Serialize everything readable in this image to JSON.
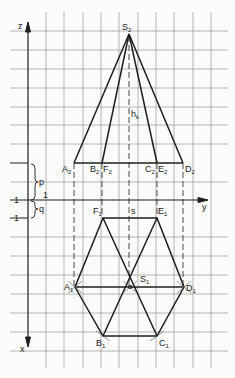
{
  "diagram": {
    "type": "orthographic-projection",
    "colors": {
      "grid": "#9a9a9a",
      "lines": "#1e1e1e",
      "background": "#fbfbfa"
    },
    "axes": {
      "z_label": "z",
      "x_label": "x",
      "y_label": "y"
    },
    "front_view": {
      "apex": {
        "label": "S",
        "sub": "2",
        "x": 129,
        "y": 33
      },
      "height_label": {
        "text": "h",
        "sub": "k"
      },
      "base_points": [
        {
          "label": "A",
          "sub": "2",
          "x": 74
        },
        {
          "label": "B",
          "sub": "2",
          "x": 102
        },
        {
          "label": "F",
          "sub": "2",
          "x": 102
        },
        {
          "label": "C",
          "sub": "2",
          "x": 157
        },
        {
          "label": "E",
          "sub": "2",
          "x": 157
        },
        {
          "label": "D",
          "sub": "2",
          "x": 183
        }
      ],
      "base_y": 163
    },
    "top_view": {
      "center": {
        "label": "S",
        "sub": "1",
        "x": 130,
        "y": 287
      },
      "points": [
        {
          "label": "A",
          "sub": "1",
          "x": 75,
          "y": 287
        },
        {
          "label": "B",
          "sub": "1",
          "x": 103,
          "y": 336
        },
        {
          "label": "C",
          "sub": "1",
          "x": 157,
          "y": 336
        },
        {
          "label": "D",
          "sub": "1",
          "x": 184,
          "y": 287
        },
        {
          "label": "E",
          "sub": "1",
          "x": 157,
          "y": 218
        },
        {
          "label": "F",
          "sub": "1",
          "x": 103,
          "y": 218
        }
      ],
      "axis_label_s": "s"
    },
    "annotations": {
      "p": "p",
      "q": "q",
      "one_upper": "1",
      "one_lower": "1",
      "one_axis": "1"
    }
  }
}
